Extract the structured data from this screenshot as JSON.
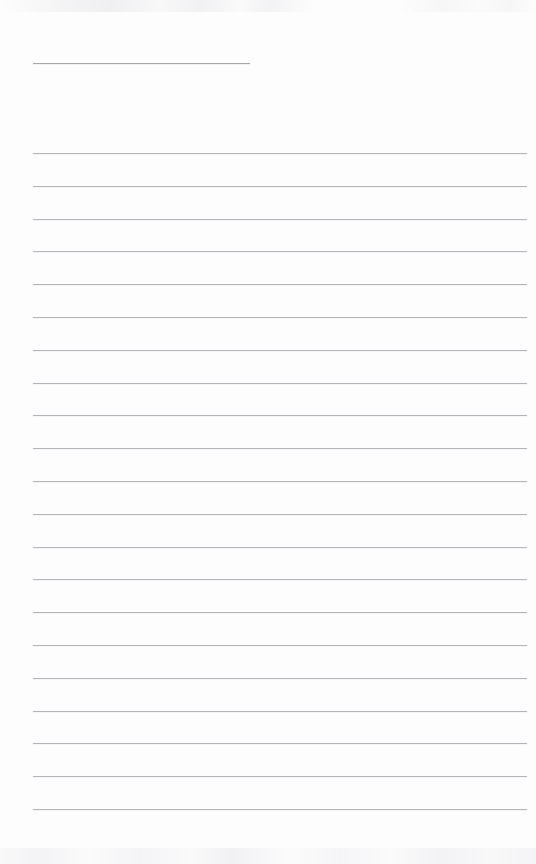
{
  "document": {
    "kind": "scanned-blank-ruled-page",
    "title": "",
    "body_text": "",
    "page_width": 536,
    "page_height": 864,
    "background_color": "#fdfdfd",
    "has_visible_text": false,
    "note": ""
  },
  "header_rule": {
    "name": "header-rule",
    "x": 33,
    "y": 63,
    "width": 217,
    "height": 1,
    "color": "#a6a6ab",
    "written_value": ""
  },
  "ruled_lines": {
    "name": "ruled-lines",
    "count": 21,
    "first_y": 153,
    "spacing": 32.8,
    "x": 33,
    "width": 494,
    "height": 1,
    "color": "#b4b4b9",
    "lines": [
      {
        "index": 1,
        "y": 153,
        "written_value": ""
      },
      {
        "index": 2,
        "y": 186,
        "written_value": ""
      },
      {
        "index": 3,
        "y": 219,
        "written_value": ""
      },
      {
        "index": 4,
        "y": 251,
        "written_value": ""
      },
      {
        "index": 5,
        "y": 284,
        "written_value": ""
      },
      {
        "index": 6,
        "y": 317,
        "written_value": ""
      },
      {
        "index": 7,
        "y": 350,
        "written_value": ""
      },
      {
        "index": 8,
        "y": 383,
        "written_value": ""
      },
      {
        "index": 9,
        "y": 415,
        "written_value": ""
      },
      {
        "index": 10,
        "y": 448,
        "written_value": ""
      },
      {
        "index": 11,
        "y": 481,
        "written_value": ""
      },
      {
        "index": 12,
        "y": 514,
        "written_value": ""
      },
      {
        "index": 13,
        "y": 547,
        "written_value": ""
      },
      {
        "index": 14,
        "y": 579,
        "written_value": ""
      },
      {
        "index": 15,
        "y": 612,
        "written_value": ""
      },
      {
        "index": 16,
        "y": 645,
        "written_value": ""
      },
      {
        "index": 17,
        "y": 678,
        "written_value": ""
      },
      {
        "index": 18,
        "y": 711,
        "written_value": ""
      },
      {
        "index": 19,
        "y": 743,
        "written_value": ""
      },
      {
        "index": 20,
        "y": 776,
        "written_value": ""
      },
      {
        "index": 21,
        "y": 809,
        "written_value": ""
      }
    ]
  },
  "scan_artifacts": {
    "name": "scan-artifacts",
    "top_band": {
      "y": 0,
      "height": 12,
      "description": "faint grey bleed-through smudge"
    },
    "bottom_band": {
      "y": 848,
      "height": 16,
      "description": "faint grey bleed-through smudge"
    }
  }
}
